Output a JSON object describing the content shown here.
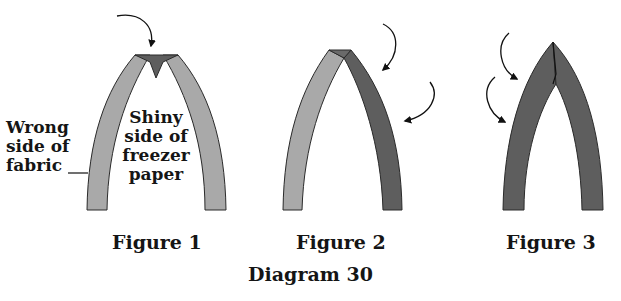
{
  "diagram": {
    "title": "Diagram 30",
    "colors": {
      "light_fabric": "#a9a9a9",
      "dark_fabric": "#5e5e5e",
      "outline": "#2a2a2a",
      "background": "#ffffff"
    },
    "figures": [
      {
        "label": "Figure 1",
        "annotations": {
          "left_label_lines": [
            "Wrong",
            "side of",
            "fabric"
          ],
          "inner_label_lines": [
            "Shiny",
            "side of",
            "freezer",
            "paper"
          ]
        },
        "arrows": 1
      },
      {
        "label": "Figure 2",
        "arrows": 2
      },
      {
        "label": "Figure 3",
        "arrows": 2
      }
    ]
  }
}
